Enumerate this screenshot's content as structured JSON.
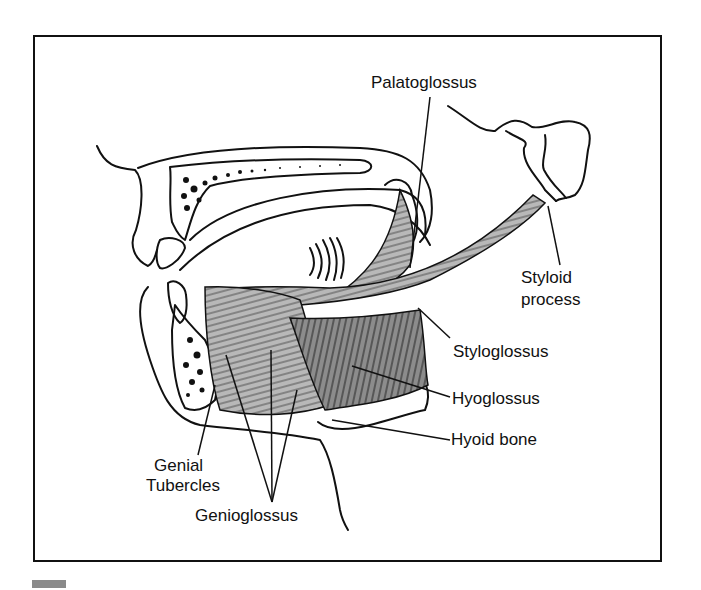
{
  "figure": {
    "labels": {
      "palatoglossus": "Palatoglossus",
      "styloid_1": "Styloid",
      "styloid_2": "process",
      "styloglossus": "Styloglossus",
      "hyoglossus": "Hyoglossus",
      "hyoid_bone": "Hyoid bone",
      "genial_1": "Genial",
      "genial_2": "Tubercles",
      "genioglossus": "Genioglossus"
    },
    "colors": {
      "line": "#111111",
      "muscle_light": "#b8b8b8",
      "muscle_dark": "#8c8c8c",
      "background": "#ffffff"
    }
  }
}
